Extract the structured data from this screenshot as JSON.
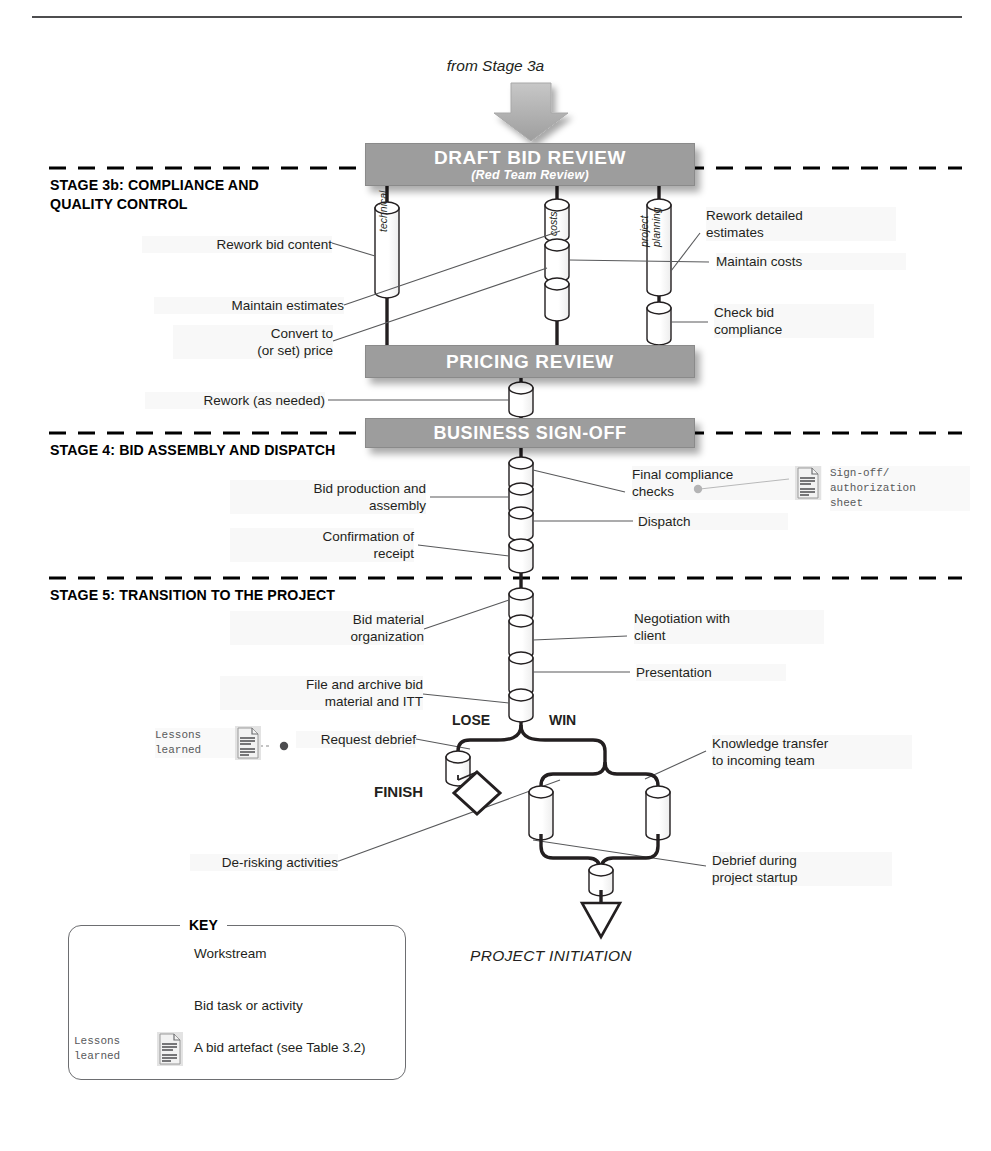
{
  "diagram": {
    "entry_note": "from Stage 3a",
    "final_note": "PROJECT INITIATION"
  },
  "stages": [
    {
      "id": "stage3b",
      "title": "STAGE 3b:  COMPLIANCE AND\n            QUALITY CONTROL"
    },
    {
      "id": "stage4",
      "title": "STAGE 4: BID ASSEMBLY AND DISPATCH"
    },
    {
      "id": "stage5",
      "title": "STAGE 5: TRANSITION TO THE PROJECT"
    }
  ],
  "bars": [
    {
      "id": "draft_bid_review",
      "line1": "DRAFT BID REVIEW",
      "line2": "(Red Team Review)"
    },
    {
      "id": "pricing_review",
      "line1": "PRICING REVIEW",
      "line2": ""
    },
    {
      "id": "business_signoff",
      "line1": "BUSINESS SIGN-OFF",
      "line2": ""
    }
  ],
  "workstreams": [
    {
      "id": "technical",
      "label": "technical"
    },
    {
      "id": "costs",
      "label": "costs"
    },
    {
      "id": "project_planning",
      "label": "project\nplanning"
    }
  ],
  "tasks": {
    "rework_bid_content": "Rework bid content",
    "maintain_estimates": "Maintain estimates",
    "convert_to_price": "Convert to\n(or set) price",
    "rework_detailed_estimates": "Rework detailed\nestimates",
    "maintain_costs": "Maintain costs",
    "check_bid_compliance": "Check bid\ncompliance",
    "rework_as_needed": "Rework (as needed)",
    "bid_production_and_assembly": "Bid production and\nassembly",
    "confirmation_of_receipt": "Confirmation of\nreceipt",
    "final_compliance_checks": "Final compliance\nchecks",
    "dispatch": "Dispatch",
    "bid_material_organization": "Bid material\norganization",
    "file_and_archive": "File and archive bid\nmaterial and ITT",
    "negotiation_with_client": "Negotiation with\nclient",
    "presentation": "Presentation",
    "request_debrief": "Request debrief",
    "de_risking_activities": "De-risking activities",
    "knowledge_transfer": "Knowledge transfer\nto incoming team",
    "debrief_during_startup": "Debrief during\nproject startup"
  },
  "branch": {
    "lose_label": "LOSE",
    "win_label": "WIN",
    "finish_label": "FINISH"
  },
  "artefacts": [
    {
      "id": "signoff_sheet",
      "label": "Sign-off/\nauthorization\nsheet"
    },
    {
      "id": "lessons_learned",
      "label": "Lessons\nlearned"
    }
  ],
  "key": {
    "title": "KEY",
    "rows": [
      {
        "id": "workstream",
        "label": "Workstream"
      },
      {
        "id": "bid_task",
        "label": "Bid task or activity"
      },
      {
        "id": "bid_artefact",
        "label": "A bid artefact (see Table 3.2)"
      }
    ],
    "artefact_caption": "Lessons\nlearned"
  },
  "colors": {
    "bar_fill": "#9d9d9d",
    "bar_text": "#ffffff",
    "line": "#231f20",
    "dashed": "#000000",
    "artefact_grey": "#808285"
  }
}
